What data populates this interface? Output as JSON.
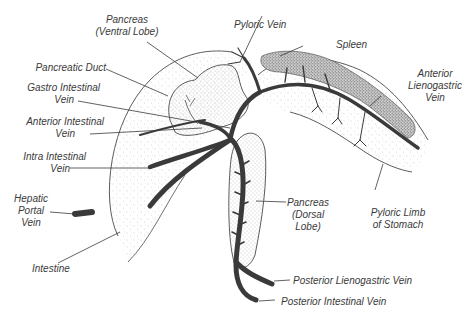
{
  "diagram": {
    "type": "anatomical illustration",
    "colors": {
      "vein": "#3a3a3a",
      "outline": "#4a4a4a",
      "stipple_light": "#9a9a9a",
      "stipple_dense": "#555555",
      "label_text": "#3a3a3a",
      "background": "#ffffff"
    }
  },
  "labels": {
    "pancreas_ventral": {
      "line1": "Pancreas",
      "line2": "(Ventral Lobe)"
    },
    "pyloric_vein": {
      "line1": "Pyloric Vein"
    },
    "spleen": {
      "line1": "Spleen"
    },
    "pancreatic_duct": {
      "line1": "Pancreatic Duct"
    },
    "anterior_lienogastric": {
      "line1": "Anterior",
      "line2": "Lienogastric",
      "line3": "Vein"
    },
    "gastro_intestinal": {
      "line1": "Gastro Intestinal",
      "line2": "Vein"
    },
    "anterior_intestinal": {
      "line1": "Anterior Intestinal",
      "line2": "Vein"
    },
    "intra_intestinal": {
      "line1": "Intra Intestinal",
      "line2": "Vein"
    },
    "hepatic_portal": {
      "line1": "Hepatic",
      "line2": "Portal",
      "line3": "Vein"
    },
    "pancreas_dorsal": {
      "line1": "Pancreas",
      "line2": "(Dorsal",
      "line3": "Lobe)"
    },
    "pyloric_limb": {
      "line1": "Pyloric Limb",
      "line2": "of Stomach"
    },
    "intestine": {
      "line1": "Intestine"
    },
    "posterior_lienogastric": {
      "line1": "Posterior Lienogastric Vein"
    },
    "posterior_intestinal": {
      "line1": "Posterior Intestinal Vein"
    }
  }
}
